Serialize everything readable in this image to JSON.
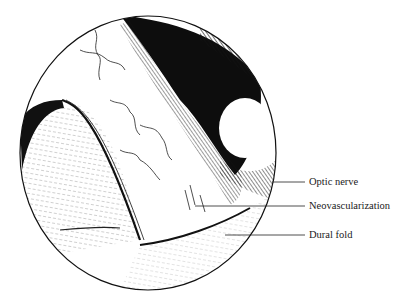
{
  "figure": {
    "type": "anatomical illustration",
    "view": "circular endoscopic view",
    "labels": [
      {
        "text": "Optic nerve",
        "y": 182
      },
      {
        "text": "Neovascularization",
        "y": 206
      },
      {
        "text": "Dural fold",
        "y": 235
      }
    ]
  }
}
